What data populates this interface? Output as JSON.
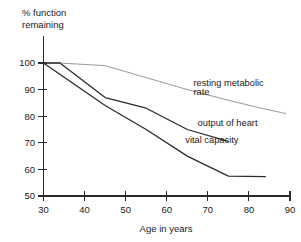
{
  "chart_data": {
    "type": "line",
    "title": "",
    "xlabel": "Age in years",
    "ylabel": "% function remaining",
    "ylabel_lines": [
      "% function",
      "remaining"
    ],
    "xlim": [
      30,
      90
    ],
    "ylim": [
      50,
      100
    ],
    "xticks": [
      30,
      40,
      50,
      60,
      70,
      80,
      90
    ],
    "yticks": [
      50,
      60,
      70,
      80,
      90,
      100
    ],
    "xtick_labels": [
      "30",
      "40",
      "50",
      "60",
      "70",
      "80",
      "90"
    ],
    "ytick_labels": [
      "50",
      "60",
      "70",
      "80",
      "90",
      "100"
    ],
    "grid": false,
    "legend": "inline-annotations",
    "series": [
      {
        "name": "resting metabolic rate",
        "label_lines": [
          "resting metabolic",
          "rate"
        ],
        "color": "#999999",
        "width": 1.0,
        "x": [
          30,
          34,
          45,
          55,
          65,
          75,
          83,
          89
        ],
        "values": [
          100,
          100,
          99,
          94.5,
          90,
          86,
          83,
          81
        ]
      },
      {
        "name": "output of heart",
        "label_lines": [
          "output of heart"
        ],
        "color": "#2b2b2b",
        "width": 1.3,
        "x": [
          30,
          34,
          45,
          55,
          65,
          75
        ],
        "values": [
          100,
          100,
          87,
          83,
          75,
          70.5
        ]
      },
      {
        "name": "vital capacity",
        "label_lines": [
          "vital capacity"
        ],
        "color": "#2b2b2b",
        "width": 1.3,
        "x": [
          30,
          45,
          55,
          65,
          75,
          84
        ],
        "values": [
          100,
          84,
          75,
          65,
          57.5,
          57.3
        ]
      }
    ],
    "annotations": [
      {
        "text": "resting metabolic",
        "x": 66.5,
        "y": 91.5
      },
      {
        "text": "rate",
        "x": 66.5,
        "y": 87.8
      },
      {
        "text": "output of heart",
        "x": 67.5,
        "y": 76.5
      },
      {
        "text": "vital capacity",
        "x": 64.5,
        "y": 70.0
      }
    ]
  },
  "axis": {
    "x_title": "Age in years",
    "y_title_line1": "% function",
    "y_title_line2": "remaining"
  }
}
